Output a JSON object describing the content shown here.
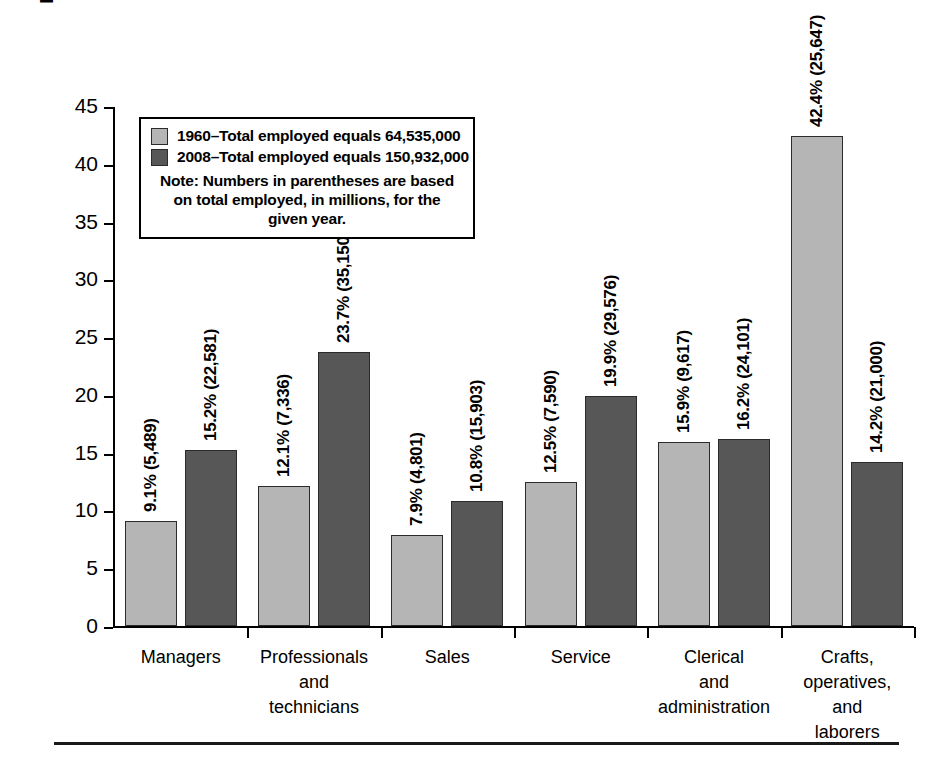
{
  "chart_data": {
    "type": "bar",
    "title": "",
    "xlabel": "",
    "ylabel": "Percentage of total workforce",
    "ylim": [
      0,
      45
    ],
    "ytick_step": 5,
    "yticks": [
      "45",
      "40",
      "35",
      "30",
      "25",
      "20",
      "15",
      "10",
      "5",
      "0"
    ],
    "grid": false,
    "legend_position": "inside-upper-left",
    "categories": [
      "Managers",
      "Professionals\nand\ntechnicians",
      "Sales",
      "Service",
      "Clerical\nand\nadministration",
      "Crafts,\noperatives,\nand\nlaborers"
    ],
    "series": [
      {
        "name": "1960–Total employed equals 64,535,000",
        "year": "1960",
        "color": "#b5b5b5",
        "values": [
          9.1,
          12.1,
          7.9,
          12.5,
          15.9,
          42.4
        ],
        "counts": [
          "5,489",
          "7,336",
          "4,801",
          "7,590",
          "9,617",
          "25,647"
        ],
        "labels": [
          "9.1% (5,489)",
          "12.1% (7,336)",
          "7.9% (4,801)",
          "12.5% (7,590)",
          "15.9% (9,617)",
          "42.4% (25,647)"
        ]
      },
      {
        "name": "2008–Total employed equals 150,932,000",
        "year": "2008",
        "color": "#575757",
        "values": [
          15.2,
          23.7,
          10.8,
          19.9,
          16.2,
          14.2
        ],
        "counts": [
          "22,581",
          "35,150",
          "15,903",
          "29,576",
          "24,101",
          "21,000"
        ],
        "labels": [
          "15.2% (22,581)",
          "23.7% (35,150)",
          "10.8% (15,903)",
          "19.9% (29,576)",
          "16.2% (24,101)",
          "14.2% (21,000)"
        ]
      }
    ],
    "note": "Note: Numbers in parentheses are based on\ntotal employed, in millions, for the given year."
  },
  "legend": {
    "entry_1960": "1960–Total employed equals 64,535,000",
    "entry_2008": "2008–Total employed equals 150,932,000",
    "note": "Note: Numbers in parentheses are based on\ntotal employed, in millions, for the given year.",
    "swatch_1960_color": "#b5b5b5",
    "swatch_2008_color": "#575757"
  },
  "axis": {
    "y_title": "Percentage of total workforce"
  }
}
